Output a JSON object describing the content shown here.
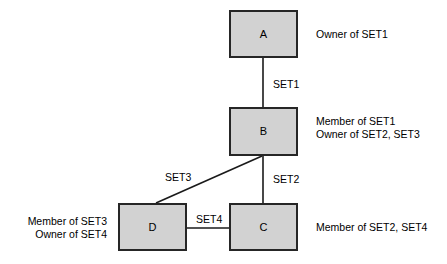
{
  "diagram": {
    "background_color": "#ffffff",
    "node_fill_color": "#d2d2d2",
    "node_border_color": "#262626",
    "edge_color": "#1a1a1a",
    "nodes": [
      {
        "id": "A",
        "label": "A",
        "x": 229,
        "y": 10,
        "width": 69,
        "height": 48,
        "annotation_lines": [
          "Owner of SET1"
        ],
        "annotation_x": 316,
        "annotation_y": 28,
        "annotation_align": "left"
      },
      {
        "id": "B",
        "label": "B",
        "x": 229,
        "y": 107,
        "width": 69,
        "height": 49,
        "annotation_lines": [
          "Member of SET1",
          "Owner of SET2, SET3"
        ],
        "annotation_x": 316,
        "annotation_y": 115,
        "annotation_align": "left"
      },
      {
        "id": "C",
        "label": "C",
        "x": 229,
        "y": 203,
        "width": 69,
        "height": 48,
        "annotation_lines": [
          "Member of SET2, SET4"
        ],
        "annotation_x": 316,
        "annotation_y": 221,
        "annotation_align": "left"
      },
      {
        "id": "D",
        "label": "D",
        "x": 118,
        "y": 203,
        "width": 69,
        "height": 48,
        "annotation_lines": [
          "Member of SET3",
          "Owner of SET4"
        ],
        "annotation_x": 18,
        "annotation_y": 215,
        "annotation_align": "right"
      }
    ],
    "edges": [
      {
        "id": "edge-set1",
        "label": "SET1",
        "from": "A",
        "to": "B",
        "x1": 263,
        "y1": 58,
        "x2": 263,
        "y2": 107,
        "label_x": 271,
        "label_y": 78
      },
      {
        "id": "edge-set2",
        "label": "SET2",
        "from": "B",
        "to": "C",
        "x1": 263,
        "y1": 156,
        "x2": 263,
        "y2": 203,
        "label_x": 271,
        "label_y": 173
      },
      {
        "id": "edge-set3",
        "label": "SET3",
        "from": "B",
        "to": "D",
        "x1": 262,
        "y1": 156,
        "x2": 156,
        "y2": 203,
        "label_x": 163,
        "label_y": 171
      },
      {
        "id": "edge-set4",
        "label": "SET4",
        "from": "D",
        "to": "C",
        "x1": 187,
        "y1": 228,
        "x2": 229,
        "y2": 228,
        "label_x": 194,
        "label_y": 213
      }
    ]
  }
}
